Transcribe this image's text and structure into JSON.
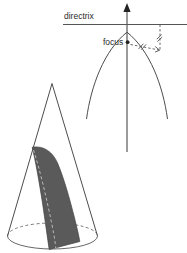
{
  "figure": {
    "background_color": "#ffffff",
    "labels": {
      "directrix": "directrix",
      "focus": "focus"
    },
    "colors": {
      "curve_stroke": "#4d4d4d",
      "axis_stroke": "#4a4a4a",
      "directrix_stroke": "#555555",
      "dashed_stroke": "#5b5b5b",
      "section_fill": "#5a5a5a",
      "section_dash": "#b9b9b9",
      "ellipse_dash": "#6a6a6a",
      "label_text": "#2b2b2b",
      "dot_fill": "#232323"
    },
    "parabola_panel": {
      "axis": {
        "x": 127,
        "y_top": 4,
        "y_bottom": 152,
        "arrow_at": "top"
      },
      "directrix": {
        "y": 24,
        "x_start": 63,
        "x_end": 187
      },
      "vertex": {
        "x": 127,
        "y": 32
      },
      "focus_point": {
        "x": 127.5,
        "y": 42
      },
      "parabola_left_end": {
        "x": 86,
        "y": 118
      },
      "parabola_right_end": {
        "x": 170,
        "y": 118
      },
      "point_on_curve": {
        "x": 160,
        "y": 50
      },
      "equal_segments": [
        {
          "name": "directrix-to-point",
          "ticks": 1
        },
        {
          "name": "focus-to-point",
          "ticks": 1
        }
      ]
    },
    "cone_panel": {
      "apex": {
        "x": 52,
        "y": 83
      },
      "base_center": {
        "x": 52.5,
        "y": 236
      },
      "base_rx": 45,
      "base_ry": 13,
      "section": {
        "shading": "dark-gray",
        "top_point": {
          "x": 32,
          "y": 147
        },
        "bottom_point": {
          "x": 49,
          "y": 249
        },
        "has_center_dashed_line": true
      }
    }
  }
}
